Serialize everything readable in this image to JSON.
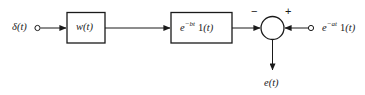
{
  "diagram": {
    "type": "block-diagram",
    "background_color": "#ffffff",
    "line_color": "#1a1a1a",
    "text_color": "#1a1a1a",
    "nodes": {
      "input_source": {
        "label_base": "δ",
        "label_arg": "(t)",
        "terminal": "open-circle"
      },
      "block_w": {
        "label_base": "w",
        "label_arg": "(t)",
        "shape": "rectangle"
      },
      "block_exp_bt": {
        "label_e": "e",
        "label_exponent": "−bt",
        "label_step": "1",
        "label_step_arg": "(t)",
        "shape": "rectangle"
      },
      "summing_junction": {
        "shape": "circle",
        "sign_left": "−",
        "sign_right": "+"
      },
      "input_exp_at": {
        "label_e": "e",
        "label_exponent": "−at",
        "label_step": "1",
        "label_step_arg": "(t)",
        "terminal": "open-circle"
      },
      "output": {
        "label_base": "e",
        "label_arg": "(t)"
      }
    },
    "connections": [
      {
        "from": "input_source",
        "to": "block_w",
        "arrow": true
      },
      {
        "from": "block_w",
        "to": "block_exp_bt",
        "arrow": true
      },
      {
        "from": "block_exp_bt",
        "to": "summing_junction",
        "arrow": true,
        "sign": "−"
      },
      {
        "from": "input_exp_at",
        "to": "summing_junction",
        "arrow": true,
        "sign": "+"
      },
      {
        "from": "summing_junction",
        "to": "output",
        "arrow": true
      }
    ]
  }
}
